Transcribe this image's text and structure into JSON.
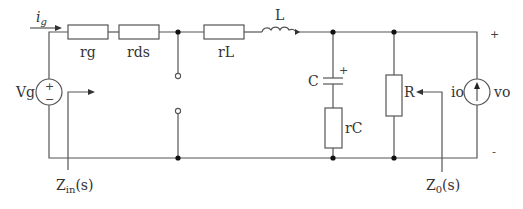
{
  "diagram": {
    "type": "circuit-schematic",
    "sources": {
      "vg": {
        "label": "Vg",
        "plus": "+",
        "minus": "−"
      },
      "io": {
        "label": "io"
      }
    },
    "current_label": {
      "main": "i",
      "sub": "g"
    },
    "resistors": {
      "rg": "rg",
      "rds": "rds",
      "rL": "rL",
      "rC": "rC",
      "R": "R"
    },
    "inductor": {
      "label": "L"
    },
    "capacitor": {
      "label": "C",
      "polarity": "+"
    },
    "output": {
      "label": "vo",
      "plus": "+",
      "minus": "-"
    },
    "impedances": {
      "zin": {
        "main": "Z",
        "sub": "in",
        "suffix": "(s)"
      },
      "z0": {
        "main": "Z",
        "sub": "0",
        "suffix": "(s)"
      }
    },
    "colors": {
      "wire": "#555555",
      "node": "#111111",
      "text": "#333333"
    }
  }
}
